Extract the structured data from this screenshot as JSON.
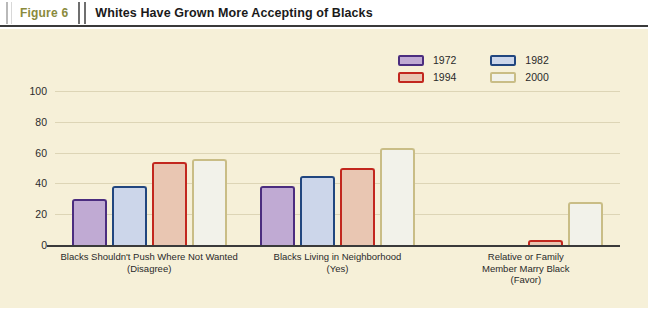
{
  "header": {
    "figure_number": "Figure 6",
    "title": "Whites Have Grown More Accepting of Blacks"
  },
  "colors": {
    "panel_background": "#f6f0d8",
    "gridline": "#ddd5b6",
    "axis": "#3a3a3a",
    "figure_number_text": "#8a8a3c",
    "series_1972_fill": "#c0aad3",
    "series_1972_border": "#4b2d7f",
    "series_1982_fill": "#ccd6ea",
    "series_1982_border": "#21467f",
    "series_1994_fill": "#e9c6b2",
    "series_1994_border": "#c2271e",
    "series_2000_fill": "#f2f2ea",
    "series_2000_border": "#c9bd86"
  },
  "chart_data": {
    "type": "bar",
    "title": "Whites Have Grown More Accepting of Blacks",
    "xlabel": "",
    "ylabel": "",
    "ylim": [
      0,
      100
    ],
    "yticks": [
      "0",
      "20",
      "40",
      "60",
      "80",
      "100"
    ],
    "ytick_values": [
      0,
      20,
      40,
      60,
      80,
      100
    ],
    "grid": true,
    "legend_position": "top-right",
    "categories": [
      "Blacks Shouldn't Push Where Not Wanted\n(Disagree)",
      "Blacks Living in Neighborhood\n(Yes)",
      "Relative or Family\nMember Marry Black\n(Favor)"
    ],
    "category_lines": [
      [
        "Blacks Shouldn't Push Where Not Wanted",
        "(Disagree)"
      ],
      [
        "Blacks Living in Neighborhood",
        "(Yes)"
      ],
      [
        "Relative or Family",
        "Member Marry Black",
        "(Favor)"
      ]
    ],
    "series": [
      {
        "name": "1972",
        "values": [
          30,
          38,
          null
        ]
      },
      {
        "name": "1982",
        "values": [
          38,
          45,
          null
        ]
      },
      {
        "name": "1994",
        "values": [
          54,
          50,
          3
        ]
      },
      {
        "name": "2000",
        "values": [
          56,
          63,
          28
        ]
      }
    ]
  }
}
